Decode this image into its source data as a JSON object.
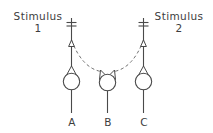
{
  "figure": {
    "background_color": "#ffffff",
    "stroke_color": "#4a4a4a",
    "text_color": "#3d3d3d"
  },
  "stimuli": [
    {
      "id": "stimulus-1",
      "word": "Stimulus",
      "number": "1"
    },
    {
      "id": "stimulus-2",
      "word": "Stimulus",
      "number": "2"
    }
  ],
  "neurons": [
    {
      "id": "neuron-a",
      "label": "A"
    },
    {
      "id": "neuron-b",
      "label": "B"
    },
    {
      "id": "neuron-c",
      "label": "C"
    }
  ]
}
